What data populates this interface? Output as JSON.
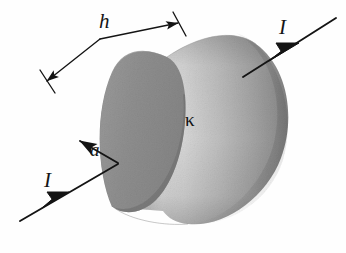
{
  "figure": {
    "type": "physics-diagram",
    "background_color": "#fefefe",
    "ink_color": "#141414",
    "labels": {
      "height": "h",
      "radius": "a",
      "current_in": "I",
      "current_out": "I",
      "conductivity": "κ"
    },
    "shading": {
      "endcap_fill": "#8f8f8f",
      "endcap_edge": "#6f6f6f",
      "body_highlight": "#dcdcdc",
      "body_mid": "#b8b8b8",
      "body_shadow": "#8c8c8c",
      "body_edge": "#7d7d7d"
    },
    "annotations": [
      {
        "name": "height-dimension",
        "label": "h",
        "description": "dimension line spanning cylinder length with end ticks"
      },
      {
        "name": "radius-arrow",
        "label": "a",
        "description": "arrow from end-cap center to rim"
      },
      {
        "name": "current-in-arrow",
        "label": "I",
        "description": "current entering left end cap"
      },
      {
        "name": "current-out-arrow",
        "label": "I",
        "description": "current exiting right end"
      },
      {
        "name": "conductivity-label",
        "label": "κ",
        "description": "material conductivity on cylinder body"
      }
    ]
  }
}
